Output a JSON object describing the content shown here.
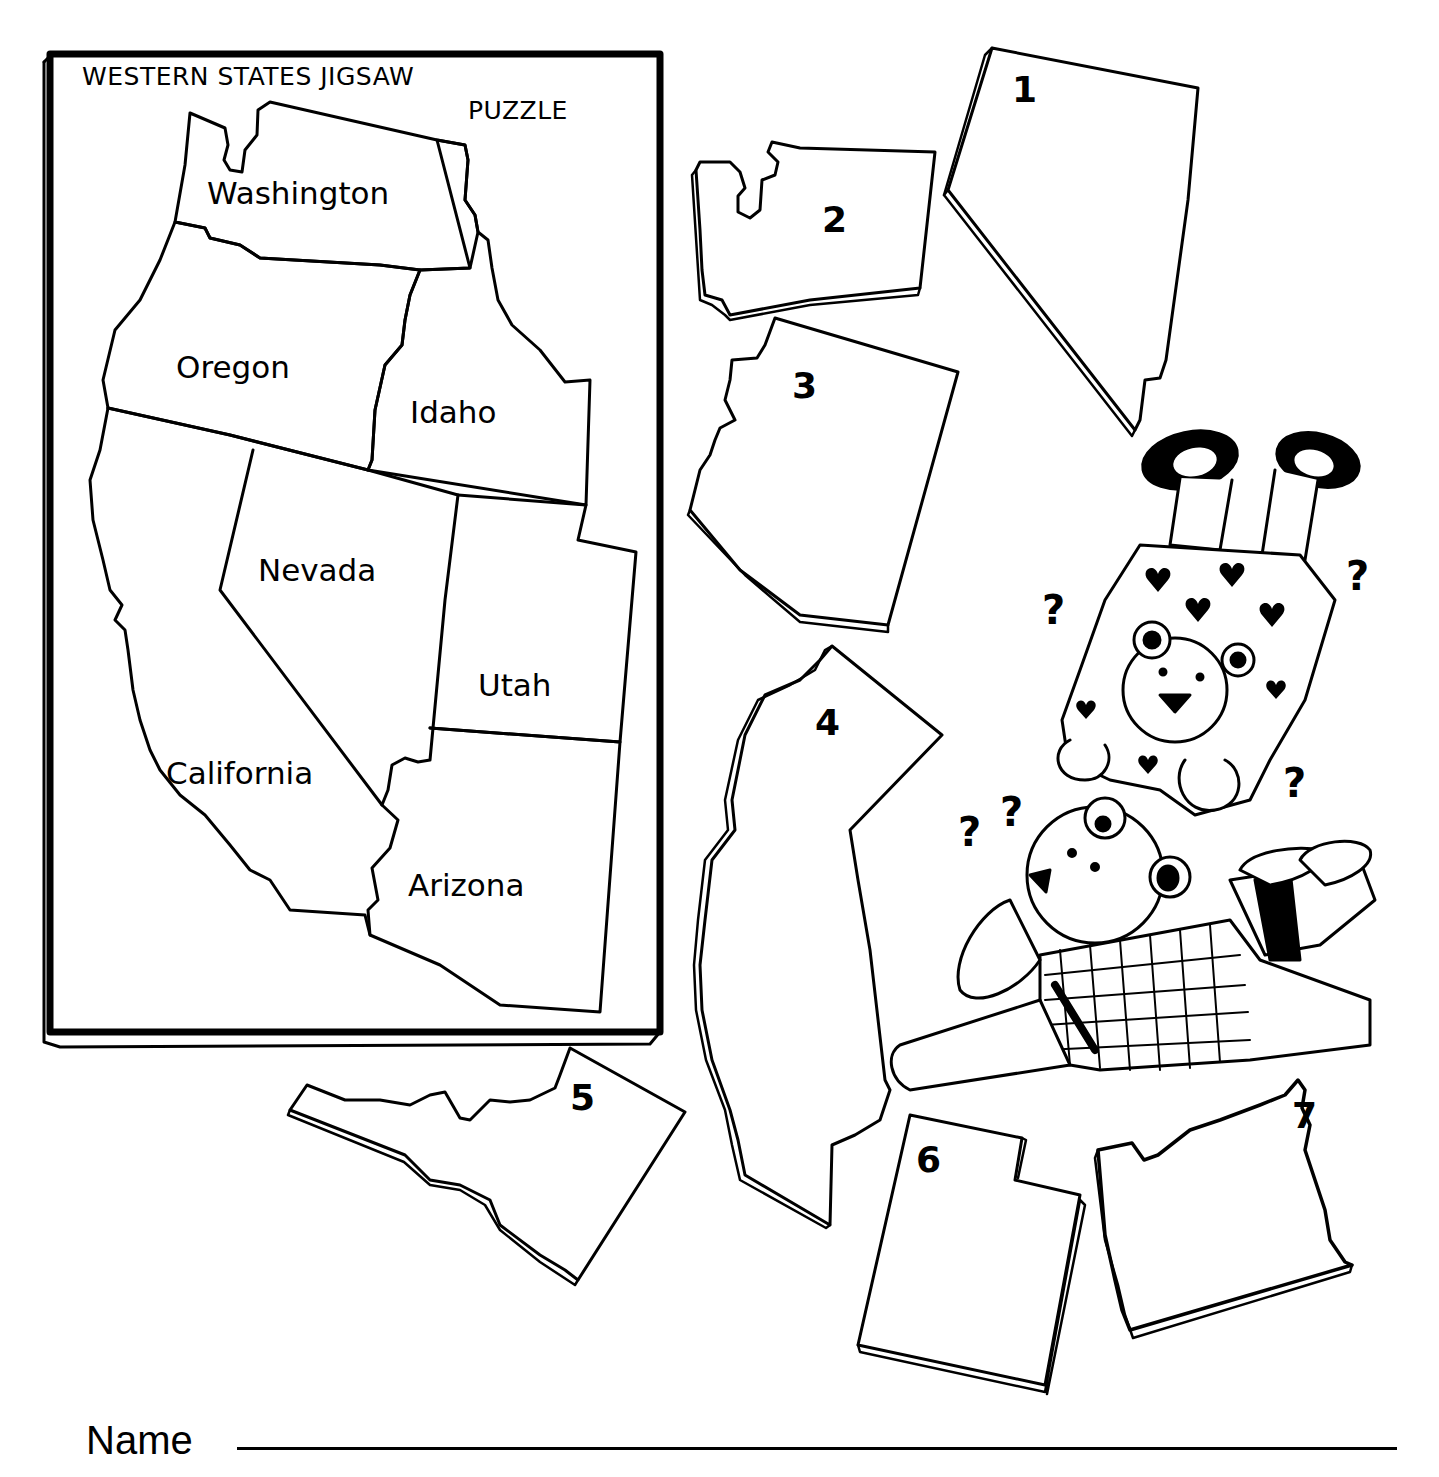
{
  "worksheet": {
    "title_line1": "WESTERN STATES JIGSAW",
    "title_line2": "PUZZLE",
    "name_label": "Name",
    "name_field_value": ""
  },
  "map": {
    "states": [
      {
        "id": "washington",
        "label": "Washington"
      },
      {
        "id": "oregon",
        "label": "Oregon"
      },
      {
        "id": "idaho",
        "label": "Idaho"
      },
      {
        "id": "nevada",
        "label": "Nevada"
      },
      {
        "id": "utah",
        "label": "Utah"
      },
      {
        "id": "california",
        "label": "California"
      },
      {
        "id": "arizona",
        "label": "Arizona"
      }
    ]
  },
  "pieces": [
    {
      "number": "1",
      "shape": "Nevada"
    },
    {
      "number": "2",
      "shape": "Washington"
    },
    {
      "number": "3",
      "shape": "Arizona"
    },
    {
      "number": "4",
      "shape": "California"
    },
    {
      "number": "5",
      "shape": "Idaho"
    },
    {
      "number": "6",
      "shape": "Utah"
    },
    {
      "number": "7",
      "shape": "Oregon"
    }
  ],
  "illustration": {
    "question_marks": [
      "?",
      "?",
      "?",
      "?",
      "?",
      "?"
    ]
  },
  "colors": {
    "ink": "#000000",
    "paper": "#ffffff"
  }
}
